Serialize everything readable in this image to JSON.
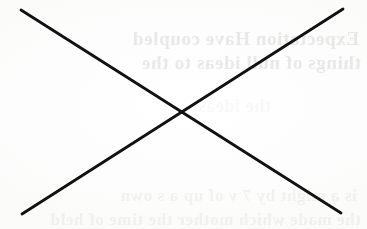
{
  "page": {
    "kind": "scanned-document-page",
    "width": 367,
    "height": 229,
    "background_color": "#fdfdfd"
  },
  "cross_out": {
    "label": "X cross-out mark",
    "ink_color": "#111111",
    "stroke_width": 2.8,
    "intersection": {
      "x": 181,
      "y": 110
    },
    "strokes": [
      {
        "name": "stroke-nw-se",
        "direction": "northwest-to-southeast",
        "x1": 21,
        "y1": 10,
        "x2": 341,
        "y2": 213
      },
      {
        "name": "stroke-ne-sw",
        "direction": "northeast-to-southwest",
        "x1": 343,
        "y1": 9,
        "x2": 22,
        "y2": 214
      }
    ]
  },
  "bleed_through": {
    "label": "Show-through text from reverse side of page",
    "legible": false,
    "mirrored": true,
    "note": "Text is reversed and too low-contrast to transcribe.",
    "rows": [
      {
        "id": "row-1",
        "text": "Expectation Have coupled",
        "opacity": "0.30"
      },
      {
        "id": "row-2",
        "text": "things of null ideas to the",
        "opacity": "0.30"
      },
      {
        "id": "row-3",
        "text": "the ideas",
        "opacity": "0.13"
      },
      {
        "id": "row-4",
        "text": "is a might by 7 v of up a s own",
        "opacity": "0.20"
      },
      {
        "id": "row-5",
        "text": "the made which mother the time of held",
        "opacity": "0.20"
      }
    ]
  }
}
